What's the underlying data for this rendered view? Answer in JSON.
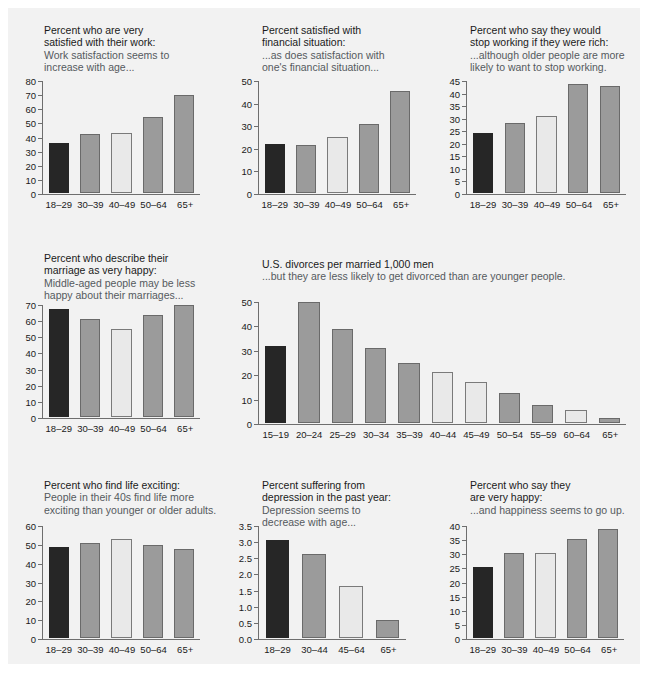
{
  "page": {
    "background": "#ffffff",
    "panel_background": "#f2f2f2",
    "colors": {
      "dark": "#262626",
      "gray": "#9b9b9b",
      "light": "#e9e9e9",
      "axis": "#6e6e6e",
      "title": "#1a1a1a",
      "subtitle": "#555a5e"
    }
  },
  "chart_data": [
    {
      "id": "work-satisfaction",
      "type": "bar",
      "title": "Percent who are very\nsatisfied with their work:",
      "subtitle": "Work satisfaction seems to\nincrease with age...",
      "categories": [
        "18–29",
        "30–39",
        "40–49",
        "50–64",
        "65+"
      ],
      "values": [
        36,
        42,
        43,
        54,
        70
      ],
      "bar_styles": [
        "dark",
        "gray",
        "light",
        "gray",
        "gray"
      ],
      "yticks": [
        0,
        10,
        20,
        30,
        40,
        50,
        60,
        70,
        80
      ],
      "ylim": [
        0,
        80
      ],
      "xlabel": "",
      "ylabel": "",
      "grid": false,
      "legend": "none"
    },
    {
      "id": "financial-satisfaction",
      "type": "bar",
      "title": "Percent satisfied with\nfinancial situation:",
      "subtitle": "...as does satisfaction with\none's financial situation...",
      "categories": [
        "18–29",
        "30–39",
        "40–49",
        "50–64",
        "65+"
      ],
      "values": [
        22,
        21.5,
        25,
        31,
        45.5
      ],
      "bar_styles": [
        "dark",
        "gray",
        "light",
        "gray",
        "gray"
      ],
      "yticks": [
        0,
        10,
        20,
        30,
        40,
        50
      ],
      "ylim": [
        0,
        50
      ],
      "xlabel": "",
      "ylabel": "",
      "grid": false,
      "legend": "none"
    },
    {
      "id": "stop-working-if-rich",
      "type": "bar",
      "title": "Percent who say they would\nstop working if they were rich:",
      "subtitle": "...although older people are more\nlikely to want to stop working.",
      "categories": [
        "18–29",
        "30–39",
        "40–49",
        "50–64",
        "65+"
      ],
      "values": [
        24,
        28,
        31,
        44,
        43
      ],
      "bar_styles": [
        "dark",
        "gray",
        "light",
        "gray",
        "gray"
      ],
      "yticks": [
        0,
        5,
        10,
        15,
        20,
        25,
        30,
        35,
        40,
        45
      ],
      "ylim": [
        0,
        45
      ],
      "xlabel": "",
      "ylabel": "",
      "grid": false,
      "legend": "none"
    },
    {
      "id": "marriage-very-happy",
      "type": "bar",
      "title": "Percent who describe their\nmarriage as very happy:",
      "subtitle": "Middle-aged people may be less\nhappy about their marriages...",
      "categories": [
        "18–29",
        "30–39",
        "40–49",
        "50–64",
        "65+"
      ],
      "values": [
        67.5,
        61,
        55,
        64,
        70
      ],
      "bar_styles": [
        "dark",
        "gray",
        "light",
        "gray",
        "gray"
      ],
      "yticks": [
        0,
        10,
        20,
        30,
        40,
        50,
        60,
        70
      ],
      "ylim": [
        0,
        70
      ],
      "xlabel": "",
      "ylabel": "",
      "grid": false,
      "legend": "none"
    },
    {
      "id": "divorces-per-1000-men",
      "type": "bar",
      "title": "U.S. divorces per married 1,000 men",
      "subtitle": "...but they are less likely to get divorced than are younger people.",
      "categories": [
        "15–19",
        "20–24",
        "25–29",
        "30–34",
        "35–39",
        "40–44",
        "45–49",
        "50–54",
        "55–59",
        "60–64",
        "65+"
      ],
      "values": [
        32,
        50,
        39,
        31,
        25,
        21,
        17,
        12.5,
        7.5,
        5.5,
        2
      ],
      "bar_styles": [
        "dark",
        "gray",
        "gray",
        "gray",
        "gray",
        "light",
        "light",
        "gray",
        "gray",
        "light",
        "gray"
      ],
      "yticks": [
        0,
        10,
        20,
        30,
        40,
        50
      ],
      "ylim": [
        0,
        50
      ],
      "xlabel": "",
      "ylabel": "",
      "grid": false,
      "legend": "none"
    },
    {
      "id": "life-exciting",
      "type": "bar",
      "title": "Percent who find life exciting:",
      "subtitle": "People in their 40s find life more\nexciting than younger or older adults.",
      "categories": [
        "18–29",
        "30–39",
        "40–49",
        "50–64",
        "65+"
      ],
      "values": [
        49,
        51,
        53,
        50,
        47.5
      ],
      "bar_styles": [
        "dark",
        "gray",
        "light",
        "gray",
        "gray"
      ],
      "yticks": [
        0,
        10,
        20,
        30,
        40,
        50,
        60
      ],
      "ylim": [
        0,
        60
      ],
      "xlabel": "",
      "ylabel": "",
      "grid": false,
      "legend": "none"
    },
    {
      "id": "depression-past-year",
      "type": "bar",
      "title": "Percent suffering from\ndepression in the past year:",
      "subtitle": "Depression seems to\ndecrease with age...",
      "categories": [
        "18–29",
        "30–44",
        "45–64",
        "65+"
      ],
      "values": [
        3.05,
        2.63,
        1.62,
        0.55
      ],
      "bar_styles": [
        "dark",
        "gray",
        "light",
        "gray"
      ],
      "yticks": [
        "0.0",
        "0.5",
        "1.0",
        "1.5",
        "2.0",
        "2.5",
        "3.0",
        "3.5"
      ],
      "ylim": [
        0,
        3.5
      ],
      "xlabel": "",
      "ylabel": "",
      "grid": false,
      "legend": "none"
    },
    {
      "id": "very-happy",
      "type": "bar",
      "title": "Percent who say they\nare very happy:",
      "subtitle": "...and happiness seems to go up.",
      "categories": [
        "18–29",
        "30–39",
        "40–49",
        "50–64",
        "65+"
      ],
      "values": [
        25.5,
        30.5,
        30.5,
        35.5,
        39
      ],
      "bar_styles": [
        "dark",
        "gray",
        "light",
        "gray",
        "gray"
      ],
      "yticks": [
        0,
        5,
        10,
        15,
        20,
        25,
        30,
        35,
        40
      ],
      "ylim": [
        0,
        40
      ],
      "xlabel": "",
      "ylabel": "",
      "grid": false,
      "legend": "none"
    }
  ]
}
